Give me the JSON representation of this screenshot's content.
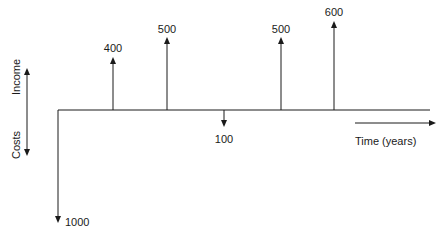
{
  "diagram": {
    "type": "cash-flow-diagram",
    "axis_labels": {
      "income": "Income",
      "costs": "Costs",
      "time": "Time (years)"
    },
    "colors": {
      "stroke": "#1a1a1a",
      "background": "#ffffff"
    },
    "cash_flows": [
      {
        "year": 0,
        "direction": "cost",
        "value": "1000"
      },
      {
        "year": 1,
        "direction": "income",
        "value": "400"
      },
      {
        "year": 2,
        "direction": "income",
        "value": "500"
      },
      {
        "year": 3,
        "direction": "cost",
        "value": "100"
      },
      {
        "year": 4,
        "direction": "income",
        "value": "500"
      },
      {
        "year": 5,
        "direction": "income",
        "value": "600"
      }
    ]
  }
}
